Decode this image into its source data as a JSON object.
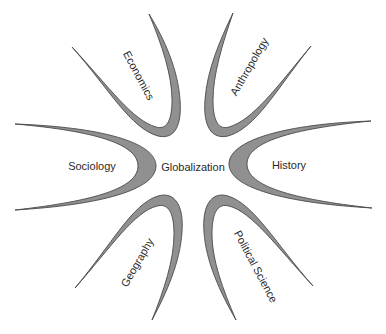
{
  "diagram": {
    "center": {
      "label": "Globalization",
      "x": 193,
      "y": 168
    },
    "colors": {
      "fill": "#909090",
      "stroke": "#4a4a4a",
      "text": "#2a2a2a",
      "background": "#ffffff"
    },
    "disciplines": [
      {
        "label": "Economics",
        "x": 138,
        "y": 76,
        "angle": 62
      },
      {
        "label": "Anthropology",
        "x": 250,
        "y": 67,
        "angle": -60
      },
      {
        "label": "Sociology",
        "x": 92,
        "y": 167,
        "angle": 0
      },
      {
        "label": "History",
        "x": 289,
        "y": 166,
        "angle": 0
      },
      {
        "label": "Geography",
        "x": 138,
        "y": 263,
        "angle": -60
      },
      {
        "label": "Political Science",
        "x": 255,
        "y": 267,
        "angle": 62
      }
    ]
  }
}
